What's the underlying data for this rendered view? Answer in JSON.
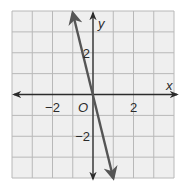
{
  "chart_data": {
    "type": "line",
    "title": "",
    "xlabel": "x",
    "ylabel": "y",
    "origin_label": "O",
    "xlim": [
      -4,
      4
    ],
    "ylim": [
      -4,
      4
    ],
    "grid": true,
    "grid_step": 1,
    "x_tick_labels": [
      {
        "value": -2,
        "label": "−2"
      },
      {
        "value": 2,
        "label": "2"
      }
    ],
    "y_tick_labels": [
      {
        "value": 2,
        "label": "2"
      },
      {
        "value": -2,
        "label": "−2"
      }
    ],
    "series": [
      {
        "name": "line",
        "equation": "y = -4x",
        "x": [
          -1,
          0,
          1
        ],
        "y": [
          4,
          0,
          -4
        ],
        "arrows_both_ends": true,
        "color": "#555555"
      }
    ],
    "colors": {
      "grid": "#b8b8b8",
      "background": "#efefef",
      "axis": "#2b2b2b",
      "line": "#555555"
    }
  }
}
